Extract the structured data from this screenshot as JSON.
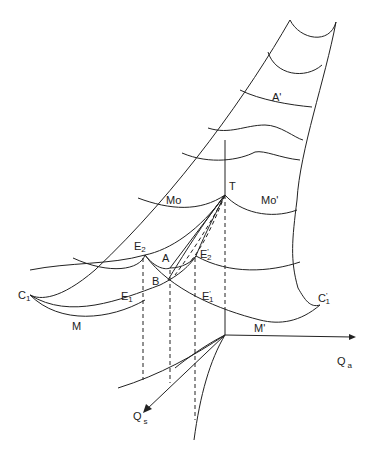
{
  "figure": {
    "labels": {
      "A_prime": "A'",
      "Mo": "Mo",
      "Mo_prime": "Mo'",
      "T": "T",
      "E2": "E",
      "E2_sub": "2",
      "E2_prime": "E",
      "E2_prime_sub": "2",
      "E2_prime_mark": "'",
      "A": "A",
      "B": "B",
      "E1": "E",
      "E1_sub": "1",
      "E1_prime": "E",
      "E1_prime_sub": "1",
      "E1_prime_mark": "'",
      "C1": "C",
      "C1_sub": "1",
      "C1_prime": "C",
      "C1_prime_sub": "1",
      "C1_prime_mark": "'",
      "M": "M",
      "M_prime": "M'",
      "Qa": "Q",
      "Qa_sub": "a",
      "Qs": "Q",
      "Qs_sub": "s"
    },
    "colors": {
      "stroke": "#222222",
      "background": "#ffffff"
    }
  }
}
